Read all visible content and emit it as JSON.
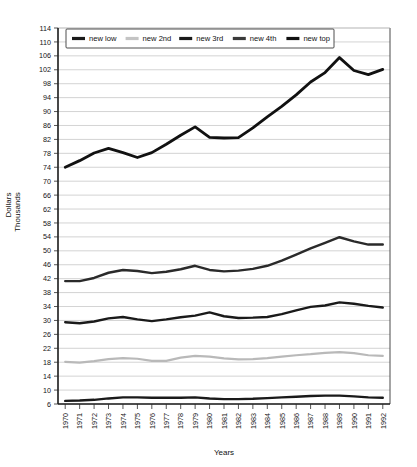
{
  "chart_data": {
    "type": "line",
    "title": "",
    "xlabel": "Years",
    "ylabel_line1": "Dollars",
    "ylabel_line2": "Thousands",
    "ylim": [
      6,
      114
    ],
    "ytick_step": 4,
    "grid": true,
    "legend_position": "top",
    "yticks": [
      6,
      10,
      14,
      18,
      22,
      26,
      30,
      34,
      38,
      42,
      46,
      50,
      54,
      58,
      62,
      66,
      70,
      74,
      78,
      82,
      86,
      90,
      94,
      98,
      102,
      106,
      110,
      114
    ],
    "categories": [
      "1970",
      "1971",
      "1972",
      "1973",
      "1974",
      "1975",
      "1976",
      "1977",
      "1978",
      "1979",
      "1980",
      "1981",
      "1982",
      "1983",
      "1984",
      "1985",
      "1986",
      "1987",
      "1988",
      "1989",
      "1990",
      "1991",
      "1992"
    ],
    "series": [
      {
        "name": "new low",
        "color": "#1a1a1a",
        "width": 2.4,
        "values": [
          6.9,
          7.0,
          7.2,
          7.6,
          7.9,
          7.9,
          7.8,
          7.8,
          7.8,
          7.9,
          7.6,
          7.4,
          7.4,
          7.5,
          7.7,
          7.9,
          8.1,
          8.3,
          8.4,
          8.4,
          8.2,
          7.9,
          7.8
        ]
      },
      {
        "name": "new 2nd",
        "color": "#b9b9b9",
        "width": 2.2,
        "values": [
          18.1,
          17.9,
          18.3,
          18.9,
          19.2,
          19.0,
          18.4,
          18.4,
          19.3,
          19.8,
          19.6,
          19.1,
          18.8,
          18.9,
          19.2,
          19.6,
          20.0,
          20.3,
          20.7,
          20.9,
          20.6,
          20.0,
          19.8
        ]
      },
      {
        "name": "new 3rd",
        "color": "#1a1a1a",
        "width": 2.4,
        "values": [
          29.5,
          29.2,
          29.7,
          30.6,
          31.0,
          30.3,
          29.8,
          30.3,
          30.9,
          31.4,
          32.3,
          31.2,
          30.7,
          30.8,
          31.0,
          31.8,
          32.9,
          33.9,
          34.3,
          35.2,
          34.8,
          34.2,
          33.7
        ]
      },
      {
        "name": "new 4th",
        "color": "#2a2a2a",
        "width": 2.4,
        "values": [
          41.3,
          41.3,
          42.2,
          43.7,
          44.5,
          44.2,
          43.6,
          44.0,
          44.7,
          45.7,
          44.5,
          44.1,
          44.3,
          44.8,
          45.7,
          47.2,
          48.9,
          50.7,
          52.3,
          53.9,
          52.7,
          51.8,
          51.8
        ]
      },
      {
        "name": "new top",
        "color": "#111111",
        "width": 2.8,
        "values": [
          74.0,
          75.9,
          78.1,
          79.4,
          78.2,
          76.8,
          78.2,
          80.6,
          83.2,
          85.6,
          82.6,
          82.4,
          82.5,
          85.3,
          88.5,
          91.5,
          94.8,
          98.5,
          101.2,
          105.5,
          101.8,
          100.6,
          102.1
        ]
      }
    ]
  },
  "legend": {
    "entries": [
      {
        "label": "new low",
        "color": "#1a1a1a"
      },
      {
        "label": "new 2nd",
        "color": "#c4c4c4"
      },
      {
        "label": "new 3rd",
        "color": "#1a1a1a"
      },
      {
        "label": "new 4th",
        "color": "#3a3a3a"
      },
      {
        "label": "new top",
        "color": "#111111"
      }
    ]
  }
}
